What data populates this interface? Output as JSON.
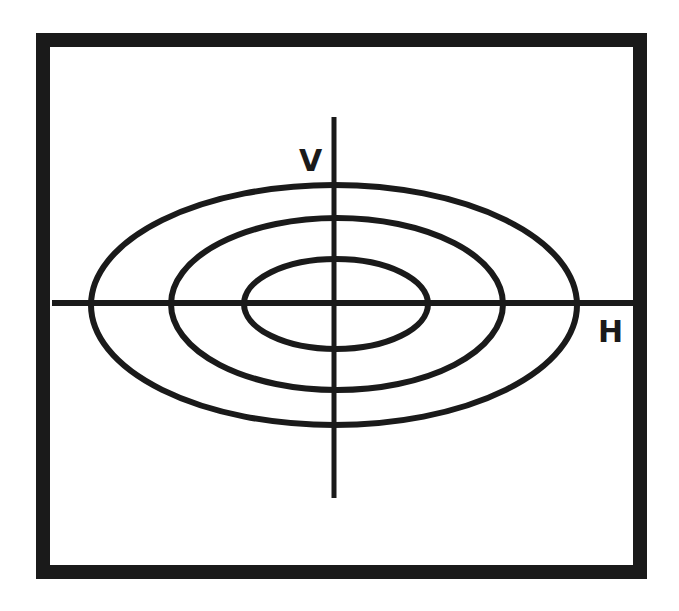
{
  "diagram": {
    "type": "concentric-ellipses-on-axes",
    "colors": {
      "background": "#ffffff",
      "stroke": "#1a1a1a"
    },
    "frame": {
      "x": 43,
      "y": 40,
      "width": 597,
      "height": 532,
      "stroke_width": 14
    },
    "axes": {
      "vertical": {
        "label": "V",
        "x": 334,
        "y1": 117,
        "y2": 498
      },
      "horizontal": {
        "label": "H",
        "y": 303,
        "x1": 52,
        "x2": 633
      }
    },
    "ellipses": [
      {
        "name": "outer",
        "cx": 334,
        "cy": 305,
        "rx": 243,
        "ry": 120
      },
      {
        "name": "middle",
        "cx": 337,
        "cy": 304,
        "rx": 166,
        "ry": 86
      },
      {
        "name": "inner",
        "cx": 336,
        "cy": 304,
        "rx": 92,
        "ry": 45
      }
    ]
  }
}
